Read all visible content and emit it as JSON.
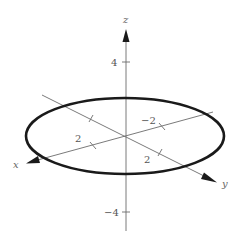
{
  "diagram": {
    "type": "3d-coordinate-plot",
    "axes": {
      "x": {
        "name": "x",
        "tick_labels": [
          "2"
        ]
      },
      "y": {
        "name": "y",
        "tick_labels": [
          "-2",
          "2"
        ]
      },
      "z": {
        "name": "z",
        "tick_labels": [
          "4",
          "-4"
        ]
      }
    },
    "curve": {
      "shape": "ellipse",
      "description": "closed ellipse (circle in the xy-plane seen in perspective) centered at origin"
    },
    "colors": {
      "curve": "#1a1a1a",
      "axes": "#6b6b6b",
      "background": "#ffffff"
    }
  },
  "labels": {
    "z_axis": "z",
    "x_axis": "x",
    "y_axis": "y",
    "z_pos_tick": "4",
    "z_neg_tick": "−4",
    "x_pos_tick": "2",
    "y_neg_tick": "−2",
    "y_pos_tick": "2"
  }
}
